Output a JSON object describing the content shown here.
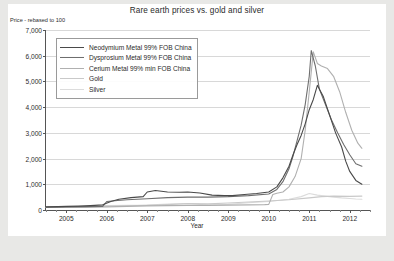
{
  "chart_data": {
    "type": "line",
    "title": "Rare earth prices vs. gold and silver",
    "ylabel": "Price - rebased to 100",
    "xlabel": "Year",
    "ylim": [
      0,
      7000
    ],
    "xlim": [
      2004.5,
      2012.5
    ],
    "grid": true,
    "legend_position": "top-left",
    "yticks": [
      "0",
      "1,000",
      "2,000",
      "3,000",
      "4,000",
      "5,000",
      "6,000",
      "7,000"
    ],
    "ytick_values": [
      0,
      1000,
      2000,
      3000,
      4000,
      5000,
      6000,
      7000
    ],
    "xticks": [
      "2005",
      "2006",
      "2007",
      "2008",
      "2009",
      "2010",
      "2011",
      "2012"
    ],
    "xtick_values": [
      2005,
      2006,
      2007,
      2008,
      2009,
      2010,
      2011,
      2012
    ],
    "series": [
      {
        "name": "Neodymium Metal 99% FOB China",
        "color": "#4a4a4a",
        "x": [
          2004.5,
          2004.8,
          2005.0,
          2005.3,
          2005.6,
          2005.9,
          2006.1,
          2006.3,
          2006.6,
          2006.9,
          2007.0,
          2007.2,
          2007.5,
          2007.8,
          2008.0,
          2008.3,
          2008.6,
          2008.9,
          2009.1,
          2009.4,
          2009.7,
          2010.0,
          2010.2,
          2010.35,
          2010.5,
          2010.6,
          2010.7,
          2010.8,
          2010.9,
          2011.0,
          2011.1,
          2011.2,
          2011.35,
          2011.5,
          2011.65,
          2011.8,
          2011.9,
          2012.0,
          2012.15,
          2012.3
        ],
        "y": [
          120,
          130,
          140,
          150,
          170,
          200,
          330,
          420,
          480,
          520,
          700,
          760,
          700,
          690,
          700,
          660,
          580,
          560,
          560,
          600,
          640,
          700,
          900,
          1250,
          1700,
          2150,
          2550,
          2900,
          3350,
          3900,
          4300,
          4850,
          4400,
          3700,
          3000,
          2450,
          1900,
          1500,
          1150,
          1000
        ]
      },
      {
        "name": "Dysprosium Metal 99% FOB China",
        "color": "#6e6e6e",
        "x": [
          2004.5,
          2005.0,
          2005.5,
          2005.9,
          2006.0,
          2006.2,
          2006.5,
          2007.0,
          2007.5,
          2008.0,
          2008.5,
          2009.0,
          2009.5,
          2010.0,
          2010.2,
          2010.35,
          2010.5,
          2010.6,
          2010.7,
          2010.8,
          2010.9,
          2011.0,
          2011.05,
          2011.15,
          2011.25,
          2011.4,
          2011.55,
          2011.7,
          2011.85,
          2012.0,
          2012.15,
          2012.3
        ],
        "y": [
          110,
          120,
          130,
          140,
          330,
          360,
          400,
          440,
          480,
          500,
          500,
          520,
          560,
          620,
          800,
          1100,
          1600,
          2100,
          2700,
          3300,
          4100,
          5200,
          6200,
          5600,
          4700,
          4100,
          3500,
          3000,
          2550,
          2150,
          1800,
          1700
        ]
      },
      {
        "name": "Cerium Metal 99% min FOB China",
        "color": "#b0b0b0",
        "x": [
          2004.5,
          2005.0,
          2005.5,
          2006.0,
          2006.5,
          2007.0,
          2007.5,
          2008.0,
          2008.5,
          2009.0,
          2009.5,
          2009.9,
          2010.0,
          2010.1,
          2010.2,
          2010.35,
          2010.5,
          2010.65,
          2010.8,
          2010.9,
          2011.0,
          2011.1,
          2011.2,
          2011.3,
          2011.45,
          2011.6,
          2011.75,
          2011.9,
          2012.05,
          2012.2,
          2012.3
        ],
        "y": [
          100,
          105,
          110,
          120,
          140,
          160,
          170,
          180,
          180,
          190,
          200,
          210,
          220,
          600,
          650,
          700,
          900,
          1300,
          2000,
          3100,
          4600,
          6150,
          5700,
          5600,
          5500,
          5200,
          4600,
          3800,
          3100,
          2600,
          2400
        ]
      },
      {
        "name": "Gold",
        "color": "#c9c9c9",
        "x": [
          2004.5,
          2005.0,
          2005.5,
          2006.0,
          2006.5,
          2007.0,
          2007.5,
          2008.0,
          2008.5,
          2009.0,
          2009.5,
          2010.0,
          2010.5,
          2011.0,
          2011.3,
          2011.6,
          2012.0,
          2012.3
        ],
        "y": [
          100,
          110,
          125,
          150,
          165,
          180,
          210,
          250,
          240,
          270,
          310,
          350,
          400,
          470,
          520,
          540,
          530,
          540
        ]
      },
      {
        "name": "Silver",
        "color": "#dcdcdc",
        "x": [
          2004.5,
          2005.0,
          2005.5,
          2006.0,
          2006.5,
          2007.0,
          2007.5,
          2008.0,
          2008.5,
          2009.0,
          2009.5,
          2010.0,
          2010.5,
          2010.8,
          2011.0,
          2011.2,
          2011.4,
          2011.6,
          2011.8,
          2012.0,
          2012.15,
          2012.3
        ],
        "y": [
          100,
          115,
          130,
          175,
          180,
          190,
          230,
          250,
          190,
          220,
          280,
          330,
          420,
          520,
          640,
          580,
          540,
          500,
          470,
          450,
          430,
          420
        ]
      }
    ]
  }
}
